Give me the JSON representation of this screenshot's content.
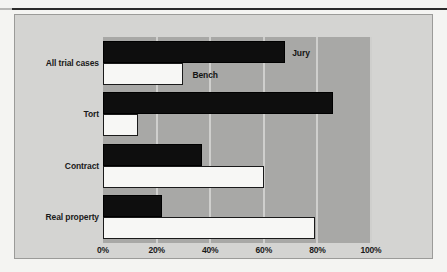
{
  "figure": {
    "background_color": "#d4d4d2",
    "plot_band_color": "#a8a8a6",
    "gridline_color": "#cfcfcd"
  },
  "series_annotations": {
    "jury_label": "Jury",
    "bench_label": "Bench"
  },
  "chart_data": {
    "type": "bar",
    "orientation": "horizontal",
    "title": "",
    "subtitle": "",
    "xlabel": "",
    "ylabel": "",
    "xlim": [
      0,
      100
    ],
    "xticks": [
      0,
      20,
      40,
      60,
      80,
      100
    ],
    "xtick_labels": [
      "0%",
      "20%",
      "40%",
      "60%",
      "80%",
      "100%"
    ],
    "grid": true,
    "grid_axis": "x",
    "legend_position": "inline-annotation",
    "categories": [
      "All trial cases",
      "Tort",
      "Contract",
      "Real property"
    ],
    "series": [
      {
        "name": "Jury",
        "color": "#0e0e0e",
        "values": [
          68,
          86,
          37,
          22
        ]
      },
      {
        "name": "Bench",
        "color": "#f7f7f5",
        "values": [
          30,
          13,
          60,
          79
        ]
      }
    ]
  }
}
